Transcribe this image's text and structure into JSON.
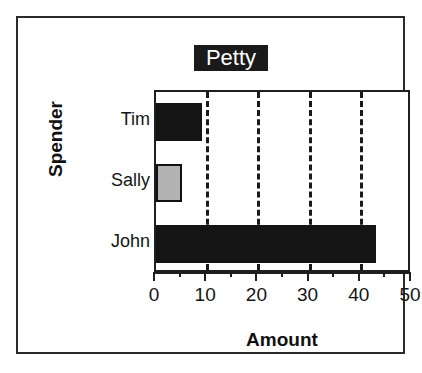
{
  "chart_data": {
    "type": "bar",
    "orientation": "horizontal",
    "title": "Petty",
    "title_state": "selected",
    "xlabel": "Amount",
    "ylabel": "Spender",
    "categories": [
      "Tim",
      "Sally",
      "John"
    ],
    "values": [
      9,
      5,
      43
    ],
    "bar_colors": [
      "#141414",
      "#b3b3b3",
      "#141414"
    ],
    "bar_edge_colors": [
      "#141414",
      "#111111",
      "#141414"
    ],
    "xlim": [
      0,
      50
    ],
    "xticks": [
      0,
      10,
      20,
      30,
      40,
      50
    ],
    "xtick_labels": [
      "0",
      "10",
      "20",
      "30",
      "40",
      "50"
    ],
    "minor_xticks": [
      5,
      15,
      25,
      35,
      45
    ],
    "gridlines": [
      10,
      20,
      30,
      40
    ],
    "grid": true,
    "grid_style": "dashed",
    "grid_color": "#1a1a1a",
    "legend": null,
    "series": [
      {
        "name": "Amount",
        "values": [
          9,
          5,
          43
        ]
      }
    ]
  },
  "figure": {
    "background": "#ffffff",
    "border_color": "#2b2b2b",
    "plot_border_color": "#1f1f1f",
    "title_highlight_bg": "#1a1a1a",
    "title_highlight_fg": "#ffffff"
  }
}
